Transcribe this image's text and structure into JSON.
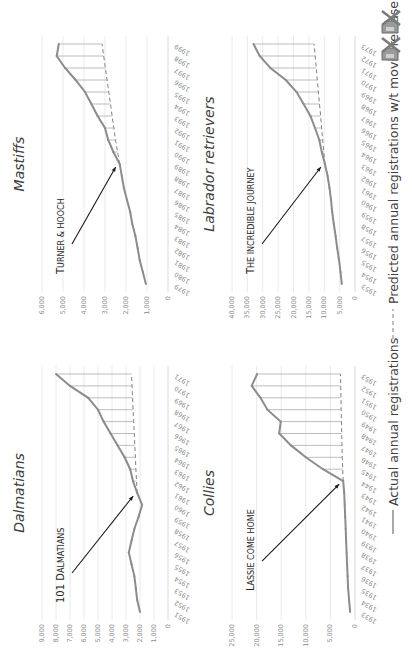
{
  "chart_data": [
    {
      "type": "line",
      "id": "dalmatians",
      "title": "Dalmatians",
      "annotation": {
        "text_first": "101 D",
        "text_rest": "ALMATIANS",
        "year": 1961
      },
      "x": [
        1951,
        1952,
        1953,
        1954,
        1955,
        1956,
        1957,
        1958,
        1959,
        1960,
        1961,
        1962,
        1963,
        1964,
        1965,
        1966,
        1967,
        1968,
        1969,
        1970,
        1971
      ],
      "series": [
        {
          "name": "Actual annual registrations",
          "values": [
            2000,
            2200,
            2300,
            2400,
            2600,
            2800,
            2600,
            2400,
            2100,
            1850,
            2200,
            2500,
            2700,
            3100,
            3600,
            4100,
            4600,
            5000,
            5700,
            7000,
            8000
          ]
        },
        {
          "name": "Predicted annual registrations w/t movie release",
          "values": [
            null,
            null,
            null,
            null,
            null,
            null,
            null,
            null,
            null,
            null,
            2200,
            2250,
            2290,
            2330,
            2370,
            2410,
            2450,
            2490,
            2530,
            2570,
            2610
          ]
        }
      ],
      "yticks": [
        "0",
        "1,000",
        "2,000",
        "3,000",
        "4,000",
        "5,000",
        "6,000",
        "7,000",
        "8,000",
        "9,000"
      ],
      "ylim": [
        0,
        9000
      ],
      "grid": true
    },
    {
      "type": "line",
      "id": "mastiffs",
      "title": "Mastiffs",
      "annotation": {
        "text_first": "T",
        "text_rest": "URNER & HOOCH",
        "year": 1989
      },
      "x": [
        1979,
        1980,
        1981,
        1982,
        1983,
        1984,
        1985,
        1986,
        1987,
        1988,
        1989,
        1990,
        1991,
        1992,
        1993,
        1994,
        1995,
        1996,
        1997,
        1998,
        1999
      ],
      "series": [
        {
          "name": "Actual annual registrations",
          "values": [
            1050,
            1200,
            1350,
            1450,
            1550,
            1700,
            1800,
            1950,
            2100,
            2200,
            2300,
            2600,
            2850,
            3000,
            3350,
            3650,
            3950,
            4400,
            4900,
            5300,
            5200
          ]
        },
        {
          "name": "Predicted annual registrations w/t movie release",
          "values": [
            null,
            null,
            null,
            null,
            null,
            null,
            null,
            null,
            null,
            null,
            2300,
            2400,
            2500,
            2580,
            2660,
            2740,
            2820,
            2900,
            2980,
            3060,
            3140
          ]
        }
      ],
      "yticks": [
        "0",
        "1,000",
        "2,000",
        "3,000",
        "4,000",
        "5,000",
        "6,000"
      ],
      "ylim": [
        0,
        6000
      ],
      "grid": true
    },
    {
      "type": "line",
      "id": "collies",
      "title": "Collies",
      "annotation": {
        "text_first": "L",
        "text_rest": "ASSIE COME HOME",
        "year": 1944
      },
      "x": [
        1933,
        1934,
        1935,
        1936,
        1937,
        1938,
        1939,
        1940,
        1941,
        1942,
        1943,
        1944,
        1945,
        1946,
        1947,
        1948,
        1949,
        1950,
        1951,
        1952,
        1953
      ],
      "series": [
        {
          "name": "Actual annual registrations",
          "values": [
            1000,
            1200,
            1400,
            1500,
            1600,
            1700,
            1800,
            1900,
            2000,
            2100,
            2200,
            2400,
            6500,
            10000,
            13000,
            15400,
            15100,
            17800,
            19200,
            21000,
            19900
          ]
        },
        {
          "name": "Predicted annual registrations w/t movie release",
          "values": [
            null,
            null,
            null,
            null,
            null,
            null,
            null,
            null,
            null,
            null,
            null,
            2400,
            2500,
            2600,
            2650,
            2700,
            2750,
            2800,
            2850,
            2900,
            2950
          ]
        }
      ],
      "yticks": [
        "0",
        "5,000",
        "10,000",
        "15,000",
        "20,000",
        "25,000"
      ],
      "ylim": [
        0,
        25000
      ],
      "grid": true
    },
    {
      "type": "line",
      "id": "labrador-retrievers",
      "title": "Labrador retrievers",
      "annotation": {
        "text_first": "T",
        "text_rest": "HE INCREDIBLE JOURNEY",
        "year": 1963
      },
      "x": [
        1953,
        1954,
        1955,
        1956,
        1957,
        1958,
        1959,
        1960,
        1961,
        1962,
        1963,
        1964,
        1965,
        1966,
        1967,
        1968,
        1969,
        1970,
        1971,
        1972,
        1973
      ],
      "series": [
        {
          "name": "Actual annual registrations",
          "values": [
            4300,
            4700,
            5200,
            5800,
            6300,
            6900,
            7400,
            7800,
            8300,
            8900,
            9800,
            10800,
            11600,
            13000,
            14500,
            16700,
            19000,
            22500,
            27500,
            31000,
            33000
          ]
        },
        {
          "name": "Predicted annual registrations w/t movie release",
          "values": [
            null,
            null,
            null,
            null,
            null,
            null,
            null,
            null,
            null,
            null,
            9800,
            10150,
            10500,
            10850,
            11200,
            11550,
            11900,
            12250,
            12600,
            12950,
            13300
          ]
        }
      ],
      "yticks": [
        "0",
        "5,000",
        "10,000",
        "15,000",
        "20,000",
        "25,000",
        "30,000",
        "35,000",
        "40,000"
      ],
      "ylim": [
        0,
        40000
      ],
      "grid": true
    }
  ],
  "legend": {
    "placement": "bottom",
    "actual_label": "Actual annual registrations",
    "predicted_label": "Predicted annual registrations w/t movie release"
  },
  "colors": {
    "actual_line": "#8c8c8c",
    "predicted_line": "#808080",
    "gap_lines": "#a0a0a0",
    "grid": "#e4e4e4",
    "arrow": "#1a1a1a"
  },
  "icons": [
    "dog-crossed-icon",
    "dog-crossed-icon"
  ]
}
